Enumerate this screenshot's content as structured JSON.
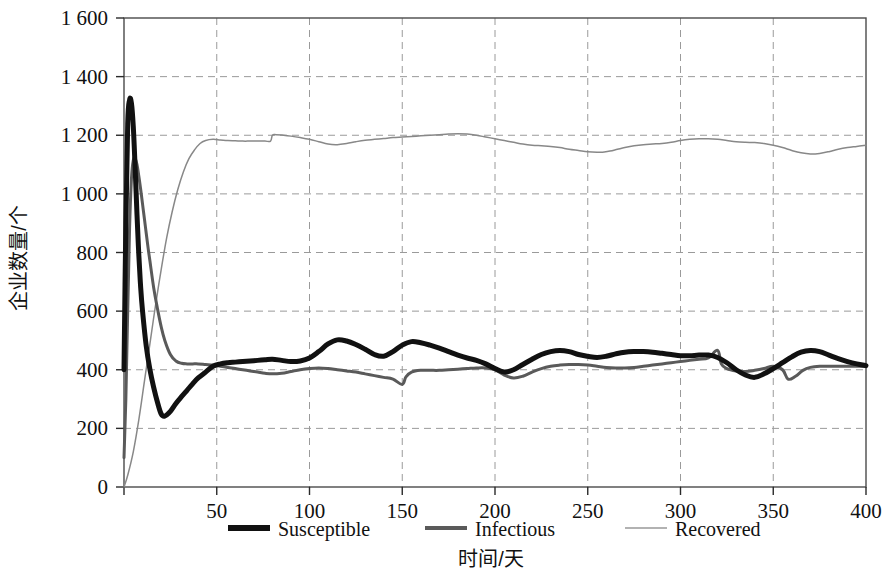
{
  "chart_data": {
    "type": "line",
    "title": "",
    "xlabel": "时间/天",
    "ylabel": "企业数量/个",
    "xlim": [
      0,
      400
    ],
    "ylim": [
      0,
      1600
    ],
    "grid": true,
    "legend_position": "bottom",
    "x_ticks": [
      0,
      50,
      100,
      150,
      200,
      250,
      300,
      350,
      400
    ],
    "x_tick_labels": [
      "0",
      "50",
      "100",
      "150",
      "200",
      "250",
      "300",
      "350",
      "400"
    ],
    "y_ticks": [
      0,
      200,
      400,
      600,
      800,
      1000,
      1200,
      1400,
      1600
    ],
    "y_tick_labels": [
      "0",
      "200",
      "400",
      "600",
      "800",
      "1 000",
      "1 200",
      "1 400",
      "1 600"
    ],
    "series": [
      {
        "name": "Susceptible",
        "color": "#111111",
        "width": 5,
        "x": [
          0,
          1,
          2,
          3,
          4,
          5,
          6,
          7,
          8,
          9,
          10,
          12,
          14,
          16,
          18,
          20,
          22,
          25,
          28,
          31,
          34,
          37,
          40,
          44,
          48,
          52,
          56,
          60,
          64,
          68,
          72,
          76,
          80,
          85,
          90,
          95,
          100,
          105,
          110,
          115,
          120,
          125,
          130,
          135,
          140,
          145,
          150,
          155,
          160,
          165,
          170,
          175,
          180,
          185,
          190,
          195,
          200,
          205,
          210,
          215,
          220,
          225,
          230,
          235,
          240,
          245,
          250,
          255,
          260,
          265,
          270,
          275,
          280,
          285,
          290,
          295,
          300,
          305,
          310,
          315,
          320,
          325,
          330,
          335,
          340,
          345,
          350,
          355,
          360,
          365,
          370,
          375,
          380,
          385,
          390,
          395,
          400
        ],
        "y": [
          400,
          900,
          1240,
          1320,
          1310,
          1230,
          1090,
          930,
          790,
          680,
          600,
          480,
          400,
          340,
          290,
          250,
          242,
          258,
          285,
          308,
          330,
          352,
          372,
          392,
          412,
          420,
          424,
          426,
          428,
          430,
          432,
          434,
          436,
          432,
          428,
          430,
          440,
          462,
          488,
          502,
          498,
          486,
          470,
          452,
          446,
          462,
          484,
          496,
          492,
          484,
          474,
          462,
          450,
          440,
          432,
          420,
          404,
          392,
          400,
          418,
          436,
          452,
          462,
          466,
          462,
          452,
          446,
          442,
          446,
          454,
          460,
          462,
          462,
          460,
          456,
          452,
          448,
          448,
          450,
          450,
          442,
          424,
          400,
          382,
          374,
          386,
          404,
          424,
          444,
          460,
          466,
          462,
          450,
          438,
          428,
          420,
          414
        ]
      },
      {
        "name": "Infectious",
        "color": "#5a5a5a",
        "width": 3,
        "x": [
          0,
          1,
          2,
          3,
          4,
          5,
          6,
          7,
          8,
          9,
          10,
          11,
          12,
          13,
          14,
          16,
          18,
          20,
          22,
          25,
          28,
          31,
          34,
          37,
          40,
          44,
          48,
          52,
          56,
          60,
          64,
          68,
          72,
          76,
          80,
          85,
          90,
          95,
          100,
          105,
          110,
          115,
          120,
          125,
          130,
          135,
          140,
          145,
          150,
          152,
          155,
          160,
          165,
          170,
          175,
          180,
          185,
          190,
          195,
          200,
          205,
          210,
          215,
          220,
          225,
          230,
          235,
          240,
          245,
          250,
          255,
          260,
          265,
          270,
          275,
          280,
          285,
          290,
          295,
          300,
          305,
          310,
          315,
          320,
          322,
          325,
          330,
          335,
          340,
          345,
          350,
          355,
          358,
          362,
          366,
          370,
          375,
          380,
          385,
          390,
          395,
          400
        ],
        "y": [
          100,
          300,
          600,
          880,
          1050,
          1115,
          1120,
          1100,
          1060,
          1015,
          965,
          915,
          865,
          815,
          770,
          680,
          610,
          548,
          500,
          452,
          430,
          422,
          420,
          420,
          420,
          418,
          416,
          412,
          408,
          404,
          400,
          396,
          392,
          388,
          386,
          388,
          394,
          400,
          404,
          406,
          404,
          400,
          396,
          392,
          386,
          380,
          374,
          368,
          350,
          376,
          392,
          398,
          398,
          398,
          400,
          402,
          404,
          406,
          406,
          400,
          382,
          372,
          378,
          392,
          404,
          412,
          416,
          418,
          418,
          416,
          412,
          408,
          406,
          406,
          408,
          412,
          416,
          420,
          424,
          428,
          432,
          436,
          440,
          466,
          420,
          404,
          396,
          394,
          398,
          404,
          412,
          400,
          368,
          378,
          398,
          408,
          412,
          412,
          412,
          412,
          412,
          412
        ]
      },
      {
        "name": "Recovered",
        "color": "#888888",
        "width": 1.5,
        "x": [
          0,
          2,
          5,
          8,
          11,
          14,
          17,
          20,
          23,
          26,
          29,
          32,
          35,
          38,
          41,
          44,
          48,
          52,
          56,
          60,
          64,
          68,
          72,
          76,
          79,
          80,
          82,
          86,
          90,
          95,
          100,
          105,
          110,
          115,
          120,
          125,
          130,
          135,
          140,
          145,
          150,
          155,
          160,
          165,
          170,
          175,
          180,
          185,
          190,
          195,
          200,
          205,
          210,
          215,
          220,
          225,
          230,
          235,
          240,
          245,
          250,
          255,
          258,
          262,
          266,
          270,
          275,
          280,
          285,
          290,
          295,
          300,
          305,
          310,
          315,
          320,
          325,
          330,
          335,
          340,
          345,
          350,
          355,
          360,
          365,
          370,
          375,
          380,
          385,
          390,
          395,
          400
        ],
        "y": [
          0,
          40,
          120,
          230,
          360,
          490,
          620,
          740,
          850,
          940,
          1015,
          1075,
          1120,
          1150,
          1172,
          1182,
          1186,
          1184,
          1182,
          1181,
          1180,
          1180,
          1180,
          1180,
          1180,
          1200,
          1202,
          1200,
          1197,
          1192,
          1186,
          1178,
          1170,
          1168,
          1172,
          1178,
          1183,
          1186,
          1189,
          1192,
          1194,
          1196,
          1198,
          1200,
          1202,
          1204,
          1205,
          1204,
          1200,
          1194,
          1188,
          1182,
          1176,
          1170,
          1166,
          1164,
          1162,
          1158,
          1152,
          1148,
          1144,
          1142,
          1142,
          1146,
          1152,
          1158,
          1164,
          1168,
          1170,
          1172,
          1176,
          1182,
          1186,
          1188,
          1188,
          1186,
          1182,
          1178,
          1176,
          1175,
          1172,
          1166,
          1158,
          1148,
          1140,
          1136,
          1138,
          1144,
          1152,
          1158,
          1162,
          1166
        ]
      }
    ]
  },
  "legend": {
    "items": [
      {
        "label": "Susceptible",
        "color": "#111111",
        "width": 6
      },
      {
        "label": "Infectious",
        "color": "#5a5a5a",
        "width": 4
      },
      {
        "label": "Recovered",
        "color": "#999999",
        "width": 1.6
      }
    ]
  },
  "axes": {
    "x_title": "时间/天",
    "y_title": "企业数量/个"
  }
}
